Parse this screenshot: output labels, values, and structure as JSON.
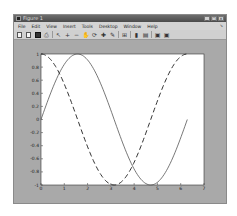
{
  "window": {
    "title": "Figure 1",
    "controls": [
      "minimize",
      "maximize",
      "close"
    ]
  },
  "menubar": {
    "items": [
      "File",
      "Edit",
      "View",
      "Insert",
      "Tools",
      "Desktop",
      "Window",
      "Help"
    ]
  },
  "toolbar": {
    "buttons": [
      {
        "name": "new-figure",
        "glyph": ""
      },
      {
        "name": "open-file",
        "glyph": ""
      },
      {
        "name": "save-figure",
        "glyph": ""
      },
      {
        "name": "print-figure",
        "glyph": "⎙"
      },
      {
        "name": "edit-plot",
        "glyph": "↖"
      },
      {
        "name": "zoom-in",
        "glyph": "+"
      },
      {
        "name": "zoom-out",
        "glyph": "−"
      },
      {
        "name": "pan",
        "glyph": "✋"
      },
      {
        "name": "rotate-3d",
        "glyph": "⟳"
      },
      {
        "name": "data-cursor",
        "glyph": "✚"
      },
      {
        "name": "brush",
        "glyph": "✎"
      },
      {
        "name": "link-plot",
        "glyph": "⊞"
      },
      {
        "name": "insert-colorbar",
        "glyph": "▮"
      },
      {
        "name": "insert-legend",
        "glyph": "▤"
      },
      {
        "name": "hide-plot-tools",
        "glyph": "▣"
      },
      {
        "name": "show-plot-tools",
        "glyph": "▣"
      }
    ]
  },
  "chart_data": {
    "type": "line",
    "title": "",
    "xlabel": "",
    "ylabel": "",
    "xlim": [
      0,
      7
    ],
    "ylim": [
      -1,
      1
    ],
    "xticks": [
      "0",
      "1",
      "2",
      "3",
      "4",
      "5",
      "6",
      "7"
    ],
    "yticks": [
      "-1",
      "-0.8",
      "-0.6",
      "-0.4",
      "-0.2",
      "0",
      "0.2",
      "0.4",
      "0.6",
      "0.8",
      "1"
    ],
    "grid": false,
    "legend": null,
    "series": [
      {
        "name": "sin(x)",
        "style": "solid",
        "x_range": [
          0,
          6.2832
        ],
        "x": [
          0,
          0.785,
          1.571,
          2.356,
          3.142,
          3.927,
          4.712,
          5.498,
          6.283
        ],
        "y": [
          0,
          0.707,
          1,
          0.707,
          0,
          -0.707,
          -1,
          -0.707,
          0
        ]
      },
      {
        "name": "cos(x)",
        "style": "dashed",
        "x_range": [
          0,
          6.2832
        ],
        "x": [
          0,
          0.785,
          1.571,
          2.356,
          3.142,
          3.927,
          4.712,
          5.498,
          6.283
        ],
        "y": [
          1,
          0.707,
          0,
          -0.707,
          -1,
          -0.707,
          0,
          0.707,
          1
        ]
      }
    ]
  }
}
